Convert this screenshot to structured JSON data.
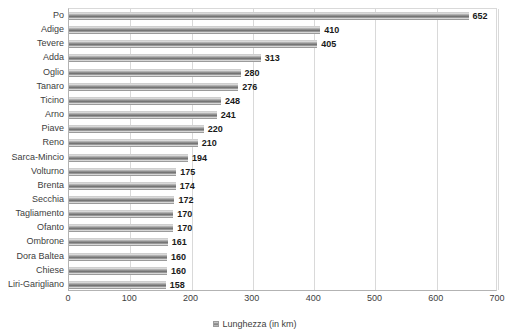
{
  "chart_data": {
    "type": "bar",
    "orientation": "horizontal",
    "title": "",
    "subtitle": "",
    "xlabel": "",
    "ylabel": "",
    "xlim": [
      0,
      700
    ],
    "xticks": [
      0,
      100,
      200,
      300,
      400,
      500,
      600,
      700
    ],
    "xtick_labels": [
      "0",
      "100",
      "200",
      "300",
      "400",
      "500",
      "600",
      "700"
    ],
    "grid": true,
    "grid_axis": "x",
    "legend": {
      "position": "bottom-center",
      "entries": [
        "Lunghezza (in km)"
      ],
      "swatch_color": "#7a7a7a"
    },
    "data_labels": true,
    "bar_color": "#8f8f8f",
    "categories": [
      "Po",
      "Adige",
      "Tevere",
      "Adda",
      "Oglio",
      "Tanaro",
      "Ticino",
      "Arno",
      "Piave",
      "Reno",
      "Sarca-Mincio",
      "Volturno",
      "Brenta",
      "Secchia",
      "Tagliamento",
      "Ofanto",
      "Ombrone",
      "Dora Baltea",
      "Chiese",
      "Liri-Garigliano"
    ],
    "series": [
      {
        "name": "Lunghezza (in km)",
        "values": [
          652,
          410,
          405,
          313,
          280,
          276,
          248,
          241,
          220,
          210,
          194,
          175,
          174,
          172,
          170,
          170,
          161,
          160,
          160,
          158
        ]
      }
    ]
  }
}
